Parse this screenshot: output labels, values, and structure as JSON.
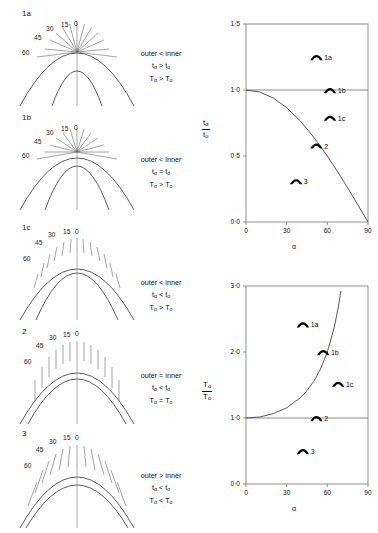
{
  "figure": {
    "angle_ticks": [
      "0",
      "15",
      "30",
      "45",
      "60"
    ],
    "panels": [
      {
        "id": "1a",
        "label": "1a",
        "relation": "outer < inner",
        "t_relation": "tα > to",
        "T_relation": "Tα > To",
        "t_sym": "t",
        "t_sub_a": "α",
        "t_op": ">",
        "t_sub_o": "o",
        "T_sym": "T",
        "T_sub_a": "α",
        "T_op": ">",
        "T_sub_o": "o"
      },
      {
        "id": "1b",
        "label": "1b",
        "relation": "outer < inner",
        "t_relation": "tα = to",
        "T_relation": "Tα > To",
        "t_sym": "t",
        "t_sub_a": "α",
        "t_op": "=",
        "t_sub_o": "o",
        "T_sym": "T",
        "T_sub_a": "α",
        "T_op": ">",
        "T_sub_o": "o"
      },
      {
        "id": "1c",
        "label": "1c",
        "relation": "outer < inner",
        "t_relation": "tα < to",
        "T_relation": "Tα > To",
        "t_sym": "t",
        "t_sub_a": "α",
        "t_op": "<",
        "t_sub_o": "o",
        "T_sym": "T",
        "T_sub_a": "α",
        "T_op": ">",
        "T_sub_o": "o"
      },
      {
        "id": "2",
        "label": "2",
        "relation": "outer = inner",
        "t_relation": "tα < to",
        "T_relation": "Tα = To",
        "t_sym": "t",
        "t_sub_a": "α",
        "t_op": "<",
        "t_sub_o": "o",
        "T_sym": "T",
        "T_sub_a": "α",
        "T_op": "=",
        "T_sub_o": "o"
      },
      {
        "id": "3",
        "label": "3",
        "relation": "outer > inner",
        "t_relation": "tα < to",
        "T_relation": "Tα < To",
        "t_sym": "t",
        "t_sub_a": "α",
        "t_op": "<",
        "t_sub_o": "o",
        "T_sym": "T",
        "T_sub_a": "α",
        "T_op": "<",
        "T_sub_o": "o"
      }
    ]
  },
  "chart_data": [
    {
      "type": "scatter",
      "id": "chart-ta-to",
      "title": "",
      "xlabel": "α",
      "ylabel": "tα / to",
      "ylabel_num": "tα",
      "ylabel_den": "to",
      "ylabel_num_sym": "t",
      "ylabel_num_sub": "α",
      "ylabel_den_sym": "t",
      "ylabel_den_sub": "o",
      "xlim": [
        0,
        90
      ],
      "ylim": [
        0,
        1.5
      ],
      "xticks": [
        0,
        30,
        60,
        90
      ],
      "xticklabels": [
        "0",
        "30",
        "60",
        "90"
      ],
      "yticks": [
        0.0,
        0.5,
        1.0,
        1.5
      ],
      "yticklabels": [
        "0·0",
        "0·5",
        "1·0",
        "1·5"
      ],
      "grid": false,
      "reference_line": {
        "y": 1.0,
        "label": "1·0"
      },
      "curve": {
        "name": "cos α",
        "x": [
          0,
          10,
          20,
          30,
          40,
          50,
          60,
          70,
          80,
          90
        ],
        "y": [
          1.0,
          0.985,
          0.94,
          0.866,
          0.766,
          0.643,
          0.5,
          0.342,
          0.174,
          0.0
        ]
      },
      "points": [
        {
          "label": "1a",
          "x": 52,
          "y": 1.25
        },
        {
          "label": "1b",
          "x": 62,
          "y": 1.0
        },
        {
          "label": "1c",
          "x": 62,
          "y": 0.79
        },
        {
          "label": "2",
          "x": 52,
          "y": 0.58
        },
        {
          "label": "3",
          "x": 37,
          "y": 0.31
        }
      ]
    },
    {
      "type": "scatter",
      "id": "chart-Ta-To",
      "title": "",
      "xlabel": "α",
      "ylabel": "Tα / To",
      "ylabel_num": "Tα",
      "ylabel_den": "To",
      "ylabel_num_sym": "T",
      "ylabel_num_sub": "α",
      "ylabel_den_sym": "T",
      "ylabel_den_sub": "o",
      "xlim": [
        0,
        90
      ],
      "ylim": [
        0,
        3.0
      ],
      "xticks": [
        0,
        30,
        60,
        90
      ],
      "xticklabels": [
        "0",
        "30",
        "60",
        "90"
      ],
      "yticks": [
        0.0,
        1.0,
        2.0,
        3.0
      ],
      "yticklabels": [
        "0·0",
        "1·0",
        "2·0",
        "3·0"
      ],
      "grid": false,
      "reference_line": {
        "y": 1.0,
        "label": "1·0"
      },
      "curve": {
        "name": "1 / cos α",
        "x": [
          0,
          10,
          20,
          30,
          40,
          45,
          50,
          55,
          60,
          65,
          68,
          70
        ],
        "y": [
          1.0,
          1.015,
          1.064,
          1.155,
          1.305,
          1.414,
          1.556,
          1.743,
          2.0,
          2.366,
          2.669,
          2.924
        ]
      },
      "points": [
        {
          "label": "1a",
          "x": 42,
          "y": 2.42
        },
        {
          "label": "1b",
          "x": 57,
          "y": 2.0
        },
        {
          "label": "1c",
          "x": 68,
          "y": 1.52
        },
        {
          "label": "2",
          "x": 52,
          "y": 1.0
        },
        {
          "label": "3",
          "x": 42,
          "y": 0.5
        }
      ]
    }
  ]
}
